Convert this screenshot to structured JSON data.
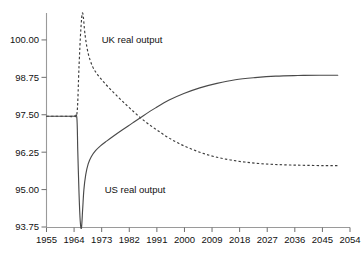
{
  "chart_data": {
    "type": "line",
    "title": "",
    "subtitle": "",
    "xlabel": "",
    "ylabel": "",
    "xlim": [
      1955,
      2054
    ],
    "ylim": [
      93.75,
      100.9
    ],
    "grid": false,
    "legend_position": "inline-annotations",
    "x_ticks": [
      "1955",
      "1964",
      "1973",
      "1982",
      "1991",
      "2000",
      "2009",
      "2018",
      "2027",
      "2036",
      "2045",
      "2054"
    ],
    "y_ticks": [
      "93.75",
      "95.00",
      "96.25",
      "97.50",
      "98.75",
      "100.00"
    ],
    "annotations": [
      {
        "text": "UK real output",
        "x": 1973,
        "y": 99.9
      },
      {
        "text": "US real output",
        "x": 1974,
        "y": 94.9
      }
    ],
    "series": [
      {
        "name": "UK real output",
        "style": "dashed",
        "color": "#3c3c3c",
        "label": "UK real output",
        "x": [
          1955,
          1958,
          1961,
          1964,
          1965,
          1965.6,
          1966.2,
          1966.8,
          1967.6,
          1968.6,
          1970,
          1971.6,
          1973.4,
          1975.4,
          1977.6,
          1980,
          1982.6,
          1985.4,
          1988.4,
          1991.6,
          1995,
          1998.6,
          2002.4,
          2006.4,
          2010.6,
          2015,
          2019.6,
          2024.4,
          2029.4,
          2034.6,
          2040,
          2045.6,
          2050
        ],
        "y": [
          97.45,
          97.45,
          97.45,
          97.45,
          97.6,
          99.1,
          100.35,
          100.9,
          100.15,
          99.55,
          99.12,
          98.85,
          98.62,
          98.4,
          98.17,
          97.93,
          97.68,
          97.42,
          97.18,
          96.95,
          96.72,
          96.52,
          96.35,
          96.2,
          96.08,
          95.99,
          95.92,
          95.87,
          95.84,
          95.82,
          95.81,
          95.8,
          95.8
        ]
      },
      {
        "name": "US real output",
        "style": "solid",
        "color": "#4a4a4a",
        "label": "US real output",
        "x": [
          1955,
          1958,
          1961,
          1964,
          1964.9,
          1965.2,
          1965.6,
          1966.0,
          1966.4,
          1966.8,
          1967.2,
          1967.8,
          1968.6,
          1969.6,
          1971,
          1972.6,
          1974.6,
          1977,
          1979.8,
          1983,
          1986.6,
          1990.6,
          1995,
          1999.8,
          2005,
          2010.6,
          2016.6,
          2023,
          2029.8,
          2037,
          2044,
          2050
        ],
        "y": [
          97.45,
          97.45,
          97.45,
          97.45,
          97.4,
          96.3,
          94.9,
          93.95,
          93.72,
          94.35,
          95.0,
          95.5,
          95.86,
          96.1,
          96.3,
          96.46,
          96.62,
          96.8,
          97.0,
          97.22,
          97.47,
          97.73,
          97.99,
          98.21,
          98.4,
          98.55,
          98.67,
          98.74,
          98.79,
          98.81,
          98.82,
          98.82
        ]
      }
    ]
  }
}
